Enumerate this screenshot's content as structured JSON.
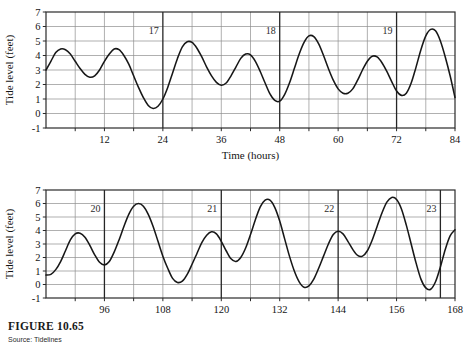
{
  "figure": {
    "caption_title": "FIGURE 10.65",
    "source": "Source: Tidelines",
    "partial_top_title": ""
  },
  "chart_data": [
    {
      "id": "tide-chart-top",
      "type": "line",
      "title": "",
      "xlabel": "Time (hours)",
      "ylabel": "Tide level (feet)",
      "xlim": [
        0,
        84
      ],
      "ylim": [
        -1,
        7
      ],
      "grid": true,
      "legend": "none",
      "xticks": [
        12,
        24,
        36,
        48,
        60,
        72,
        84
      ],
      "xtick_labels": [
        "12",
        "24",
        "36",
        "48",
        "60",
        "72",
        "84"
      ],
      "x_minor_step": 6,
      "yticks": [
        -1,
        0,
        1,
        2,
        3,
        4,
        5,
        6,
        7
      ],
      "ytick_labels": [
        "-1",
        "0",
        "1",
        "2",
        "3",
        "4",
        "5",
        "6",
        "7"
      ],
      "day_markers": [
        {
          "label": "17",
          "x": 24
        },
        {
          "label": "18",
          "x": 48
        },
        {
          "label": "19",
          "x": 72
        }
      ],
      "x": [
        0,
        1,
        2,
        3,
        4,
        5,
        6,
        7,
        8,
        9,
        10,
        11,
        12,
        13,
        14,
        15,
        16,
        17,
        18,
        19,
        20,
        21,
        22,
        23,
        24,
        25,
        26,
        27,
        28,
        29,
        30,
        31,
        32,
        33,
        34,
        35,
        36,
        37,
        38,
        39,
        40,
        41,
        42,
        43,
        44,
        45,
        46,
        47,
        48,
        49,
        50,
        51,
        52,
        53,
        54,
        55,
        56,
        57,
        58,
        59,
        60,
        61,
        62,
        63,
        64,
        65,
        66,
        67,
        68,
        69,
        70,
        71,
        72,
        73,
        74,
        75,
        76,
        77,
        78,
        79,
        80,
        81,
        82,
        83,
        84
      ],
      "y": [
        3.0,
        3.6,
        4.2,
        4.45,
        4.4,
        4.1,
        3.6,
        3.1,
        2.7,
        2.5,
        2.6,
        3.0,
        3.6,
        4.1,
        4.45,
        4.4,
        4.0,
        3.4,
        2.6,
        1.8,
        1.1,
        0.55,
        0.35,
        0.5,
        1.0,
        1.8,
        2.8,
        3.8,
        4.6,
        4.95,
        4.9,
        4.5,
        3.9,
        3.2,
        2.6,
        2.15,
        1.95,
        2.1,
        2.6,
        3.2,
        3.8,
        4.1,
        4.05,
        3.6,
        2.9,
        2.1,
        1.35,
        0.9,
        0.85,
        1.3,
        2.1,
        3.1,
        4.1,
        4.9,
        5.35,
        5.3,
        4.8,
        4.0,
        3.1,
        2.3,
        1.7,
        1.4,
        1.4,
        1.7,
        2.3,
        3.0,
        3.6,
        3.95,
        3.9,
        3.5,
        2.9,
        2.2,
        1.55,
        1.25,
        1.4,
        2.1,
        3.2,
        4.4,
        5.35,
        5.8,
        5.7,
        5.0,
        3.9,
        2.6,
        1.1
      ]
    },
    {
      "id": "tide-chart-bottom",
      "type": "line",
      "title": "",
      "xlabel": "",
      "ylabel": "Tide level (feet)",
      "xlim": [
        84,
        168
      ],
      "ylim": [
        -1,
        7
      ],
      "grid": true,
      "legend": "none",
      "xticks": [
        96,
        108,
        120,
        132,
        144,
        156,
        168
      ],
      "xtick_labels": [
        "96",
        "108",
        "120",
        "132",
        "144",
        "156",
        "168"
      ],
      "x_minor_step": 6,
      "yticks": [
        -1,
        0,
        1,
        2,
        3,
        4,
        5,
        6,
        7
      ],
      "ytick_labels": [
        "-1",
        "0",
        "1",
        "2",
        "3",
        "4",
        "5",
        "6",
        "7"
      ],
      "day_markers": [
        {
          "label": "20",
          "x": 96
        },
        {
          "label": "21",
          "x": 120
        },
        {
          "label": "22",
          "x": 144
        },
        {
          "label": "23",
          "x": 165
        }
      ],
      "x": [
        84,
        85,
        86,
        87,
        88,
        89,
        90,
        91,
        92,
        93,
        94,
        95,
        96,
        97,
        98,
        99,
        100,
        101,
        102,
        103,
        104,
        105,
        106,
        107,
        108,
        109,
        110,
        111,
        112,
        113,
        114,
        115,
        116,
        117,
        118,
        119,
        120,
        121,
        122,
        123,
        124,
        125,
        126,
        127,
        128,
        129,
        130,
        131,
        132,
        133,
        134,
        135,
        136,
        137,
        138,
        139,
        140,
        141,
        142,
        143,
        144,
        145,
        146,
        147,
        148,
        149,
        150,
        151,
        152,
        153,
        154,
        155,
        156,
        157,
        158,
        159,
        160,
        161,
        162,
        163,
        164,
        165,
        166,
        167,
        168
      ],
      "y": [
        0.7,
        0.75,
        1.1,
        1.7,
        2.5,
        3.3,
        3.75,
        3.8,
        3.5,
        2.9,
        2.2,
        1.65,
        1.45,
        1.7,
        2.4,
        3.3,
        4.3,
        5.2,
        5.8,
        6.0,
        5.8,
        5.2,
        4.3,
        3.2,
        2.1,
        1.2,
        0.45,
        0.15,
        0.25,
        0.75,
        1.5,
        2.3,
        3.1,
        3.65,
        3.9,
        3.75,
        3.2,
        2.5,
        1.9,
        1.7,
        2.0,
        2.7,
        3.7,
        4.8,
        5.75,
        6.25,
        6.25,
        5.7,
        4.7,
        3.4,
        2.1,
        1.0,
        0.2,
        -0.2,
        -0.1,
        0.4,
        1.2,
        2.1,
        3.0,
        3.7,
        3.95,
        3.75,
        3.2,
        2.6,
        2.15,
        2.1,
        2.5,
        3.3,
        4.3,
        5.3,
        6.1,
        6.45,
        6.3,
        5.6,
        4.4,
        3.0,
        1.6,
        0.4,
        -0.25,
        -0.35,
        0.2,
        1.3,
        2.6,
        3.6,
        4.05
      ]
    }
  ]
}
